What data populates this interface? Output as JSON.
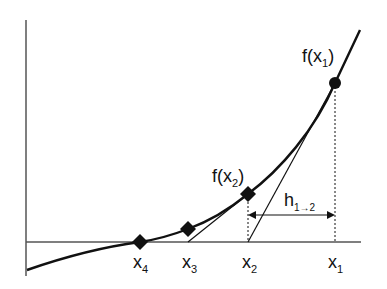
{
  "diagram": {
    "type": "secant-method-iteration",
    "labels": {
      "f_x1": {
        "base": "f(x",
        "sub": "1",
        "close": ")"
      },
      "f_x2": {
        "base": "f(x",
        "sub": "2",
        "close": ")"
      },
      "h": {
        "base": "h",
        "sub": "1→2"
      },
      "x1": {
        "base": "x",
        "sub": "1"
      },
      "x2": {
        "base": "x",
        "sub": "2"
      },
      "x3": {
        "base": "x",
        "sub": "3"
      },
      "x4": {
        "base": "x",
        "sub": "4"
      }
    },
    "points": [
      {
        "name": "f(x1)",
        "marker": "circle"
      },
      {
        "name": "f(x2)",
        "marker": "diamond"
      },
      {
        "name": "x3 point",
        "marker": "diamond"
      },
      {
        "name": "x4 root",
        "marker": "diamond"
      }
    ],
    "colors": {
      "line": "#111111",
      "axis": "#555555",
      "background": "#ffffff"
    }
  }
}
